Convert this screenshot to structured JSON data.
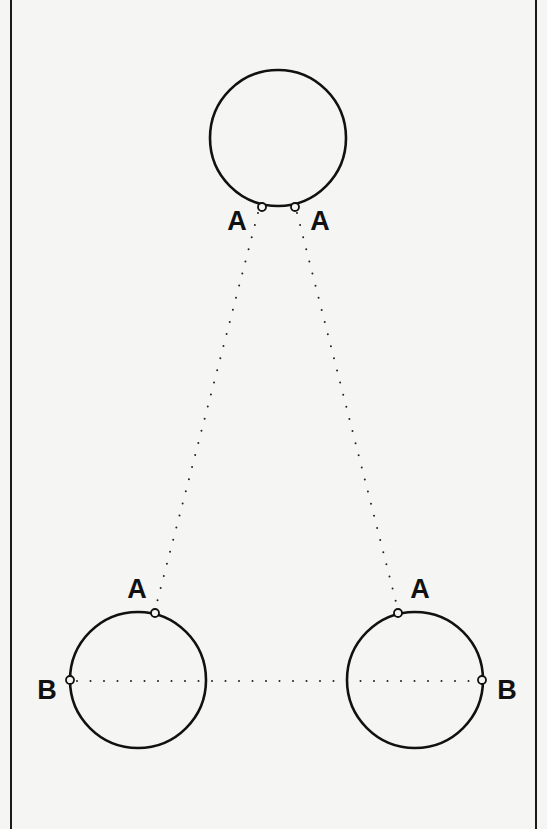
{
  "figure": {
    "background": "#f5f5f4",
    "stroke_color": "#111111",
    "border": {
      "left_x": 11,
      "right_x": 536
    },
    "circles": [
      {
        "id": "top",
        "cx": 278,
        "cy": 138,
        "r": 68
      },
      {
        "id": "bottom-left",
        "cx": 138,
        "cy": 680,
        "r": 68
      },
      {
        "id": "bottom-right",
        "cx": 415,
        "cy": 680,
        "r": 68
      }
    ],
    "points": [
      {
        "id": "top-a-left",
        "label": "A",
        "cx": 262,
        "cy": 207
      },
      {
        "id": "top-a-right",
        "label": "A",
        "cx": 295,
        "cy": 207
      },
      {
        "id": "bl-a",
        "label": "A",
        "cx": 155,
        "cy": 613
      },
      {
        "id": "bl-b",
        "label": "B",
        "cx": 70,
        "cy": 680
      },
      {
        "id": "br-a",
        "label": "A",
        "cx": 398,
        "cy": 613
      },
      {
        "id": "br-b",
        "label": "B",
        "cx": 482,
        "cy": 680
      }
    ],
    "labels": {
      "top_left_a": "A",
      "top_right_a": "A",
      "bottom_left_a": "A",
      "bottom_left_b": "B",
      "bottom_right_a": "A",
      "bottom_right_b": "B"
    },
    "dotted_lines": [
      {
        "id": "a-left",
        "from": [
          258,
          213
        ],
        "to": [
          156,
          606
        ]
      },
      {
        "id": "a-right",
        "from": [
          297,
          213
        ],
        "to": [
          397,
          606
        ]
      },
      {
        "id": "b-b",
        "from": [
          77,
          681
        ],
        "to": [
          476,
          681
        ]
      }
    ]
  }
}
